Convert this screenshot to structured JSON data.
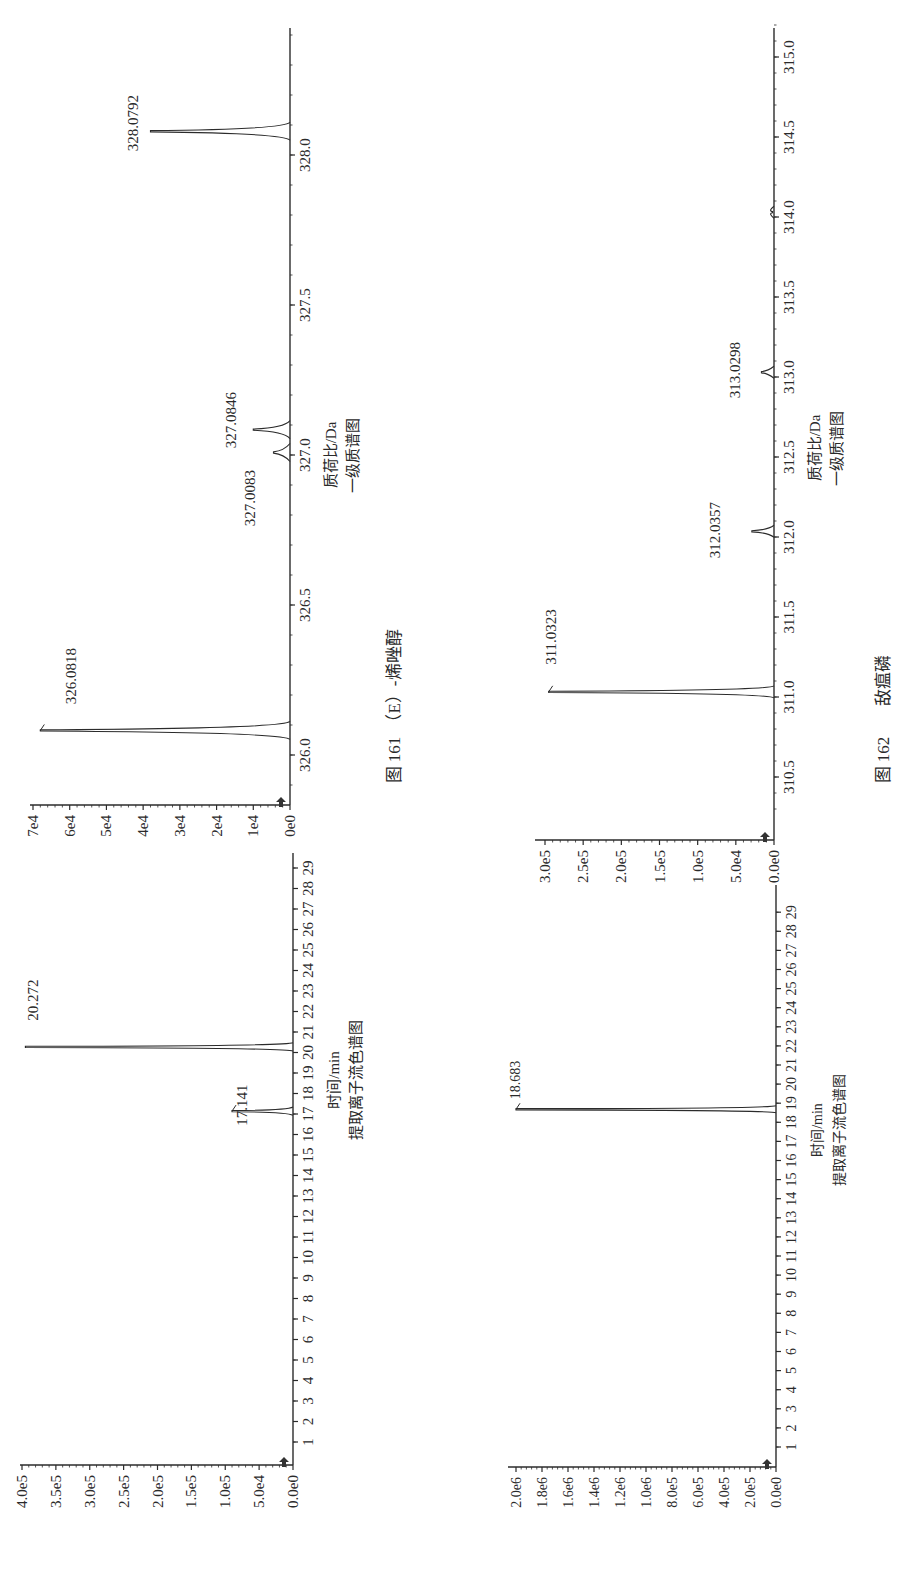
{
  "page": {
    "orientation": "rotated-90-ccw",
    "figures": [
      {
        "caption_number": "图 161",
        "caption_title": "（E）-烯唑醇",
        "spectrum": {
          "subtitle": "一级质谱图",
          "xlabel": "质荷比/Da",
          "peak_labels": [
            "328.0792",
            "327.0846",
            "327.0083",
            "326.0818"
          ],
          "x_ticks": [
            "326.0",
            "326.5",
            "327.0",
            "327.5",
            "328.0"
          ],
          "y_ticks": [
            "0e0",
            "1e4",
            "2e4",
            "3e4",
            "4e4",
            "5e4",
            "6e4",
            "7e4"
          ]
        },
        "chromatogram": {
          "subtitle": "提取离子流色谱图",
          "xlabel": "时间/min",
          "peak_labels": [
            "20.272",
            "17.141"
          ],
          "x_ticks": [
            "1",
            "2",
            "3",
            "4",
            "5",
            "6",
            "7",
            "8",
            "9",
            "10",
            "11",
            "12",
            "13",
            "14",
            "15",
            "16",
            "17",
            "18",
            "19",
            "20",
            "21",
            "22",
            "23",
            "24",
            "25",
            "26",
            "27",
            "28",
            "29"
          ],
          "y_ticks": [
            "0.0e0",
            "5.0e4",
            "1.0e5",
            "1.5e5",
            "2.0e5",
            "2.5e5",
            "3.0e5",
            "3.5e5",
            "4.0e5"
          ]
        }
      },
      {
        "caption_number": "图 162",
        "caption_title": "敌瘟磷",
        "spectrum": {
          "subtitle": "一级质谱图",
          "xlabel": "质荷比/Da",
          "peak_labels": [
            "311.0323",
            "312.0357",
            "313.0298"
          ],
          "x_ticks": [
            "310.5",
            "311.0",
            "311.5",
            "312.0",
            "312.5",
            "313.0",
            "313.5",
            "314.0",
            "314.5",
            "315.0"
          ],
          "y_ticks": [
            "0.0e0",
            "5.0e4",
            "1.0e5",
            "1.5e5",
            "2.0e5",
            "2.5e5",
            "3.0e5"
          ]
        },
        "chromatogram": {
          "subtitle": "提取离子流色谱图",
          "xlabel": "时间/min",
          "peak_labels": [
            "18.683"
          ],
          "x_ticks": [
            "1",
            "2",
            "3",
            "4",
            "5",
            "6",
            "7",
            "8",
            "9",
            "10",
            "11",
            "12",
            "13",
            "14",
            "15",
            "16",
            "17",
            "18",
            "19",
            "20",
            "21",
            "22",
            "23",
            "24",
            "25",
            "26",
            "27",
            "28",
            "29"
          ],
          "y_ticks": [
            "0.0e0",
            "2.0e5",
            "4.0e5",
            "6.0e5",
            "8.0e5",
            "1.0e6",
            "1.2e6",
            "1.4e6",
            "1.6e6",
            "1.8e6",
            "2.0e6"
          ]
        }
      }
    ]
  },
  "chart_data": [
    {
      "type": "line",
      "title": "图 161 （E）-烯唑醇 — 一级质谱图",
      "xlabel": "质荷比/Da",
      "ylabel": "",
      "xlim": [
        325.9,
        328.4
      ],
      "ylim": [
        0,
        70000
      ],
      "x_ticks": [
        326.0,
        326.5,
        327.0,
        327.5,
        328.0
      ],
      "y_ticks": [
        "0e0",
        "1e4",
        "2e4",
        "3e4",
        "4e4",
        "5e4",
        "6e4",
        "7e4"
      ],
      "peaks": [
        {
          "x": 326.0818,
          "y": 68000,
          "label": "326.0818"
        },
        {
          "x": 327.0083,
          "y": 4500,
          "label": "327.0083"
        },
        {
          "x": 327.0846,
          "y": 10000,
          "label": "327.0846"
        },
        {
          "x": 328.0792,
          "y": 38000,
          "label": "328.0792"
        }
      ],
      "grid": false
    },
    {
      "type": "line",
      "title": "图 161 （E）-烯唑醇 — 提取离子流色谱图",
      "xlabel": "时间/min",
      "ylabel": "",
      "xlim": [
        0,
        29.5
      ],
      "ylim": [
        0,
        400000
      ],
      "x_ticks": [
        1,
        2,
        3,
        4,
        5,
        6,
        7,
        8,
        9,
        10,
        11,
        12,
        13,
        14,
        15,
        16,
        17,
        18,
        19,
        20,
        21,
        22,
        23,
        24,
        25,
        26,
        27,
        28,
        29
      ],
      "y_ticks": [
        "0.0e0",
        "5.0e4",
        "1.0e5",
        "1.5e5",
        "2.0e5",
        "2.5e5",
        "3.0e5",
        "3.5e5",
        "4.0e5"
      ],
      "peaks": [
        {
          "x": 17.141,
          "y": 90000,
          "label": "17.141"
        },
        {
          "x": 20.272,
          "y": 395000,
          "label": "20.272"
        }
      ],
      "grid": false
    },
    {
      "type": "line",
      "title": "图 162 敌瘟磷 — 一级质谱图",
      "xlabel": "质荷比/Da",
      "ylabel": "",
      "xlim": [
        310.3,
        315.2
      ],
      "ylim": [
        0,
        310000
      ],
      "x_ticks": [
        310.5,
        311.0,
        311.5,
        312.0,
        312.5,
        313.0,
        313.5,
        314.0,
        314.5,
        315.0
      ],
      "y_ticks": [
        "0.0e0",
        "5.0e4",
        "1.0e5",
        "1.5e5",
        "2.0e5",
        "2.5e5",
        "3.0e5"
      ],
      "peaks": [
        {
          "x": 311.0323,
          "y": 305000,
          "label": "311.0323"
        },
        {
          "x": 312.0357,
          "y": 30000,
          "label": "312.0357"
        },
        {
          "x": 313.0298,
          "y": 17000,
          "label": "313.0298"
        },
        {
          "x": 314.03,
          "y": 2000,
          "label": ""
        }
      ],
      "grid": false
    },
    {
      "type": "line",
      "title": "图 162 敌瘟磷 — 提取离子流色谱图",
      "xlabel": "时间/min",
      "ylabel": "",
      "xlim": [
        0,
        29.5
      ],
      "ylim": [
        0,
        2000000
      ],
      "x_ticks": [
        1,
        2,
        3,
        4,
        5,
        6,
        7,
        8,
        9,
        10,
        11,
        12,
        13,
        14,
        15,
        16,
        17,
        18,
        19,
        20,
        21,
        22,
        23,
        24,
        25,
        26,
        27,
        28,
        29
      ],
      "y_ticks": [
        "0.0e0",
        "2.0e5",
        "4.0e5",
        "6.0e5",
        "8.0e5",
        "1.0e6",
        "1.2e6",
        "1.4e6",
        "1.6e6",
        "1.8e6",
        "2.0e6"
      ],
      "peaks": [
        {
          "x": 18.683,
          "y": 2000000,
          "label": "18.683"
        }
      ],
      "grid": false
    }
  ]
}
